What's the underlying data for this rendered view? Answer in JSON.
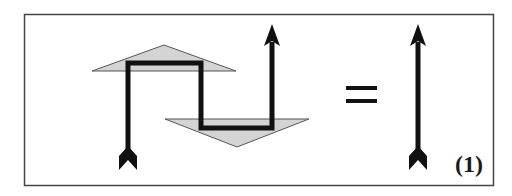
{
  "figure": {
    "equation_label": "(1)",
    "equals_sign": "=",
    "colors": {
      "stroke": "#111111",
      "triangle_fill": "#d4d4d4",
      "triangle_stroke": "#555555",
      "frame": "#444444",
      "background": "#ffffff"
    }
  }
}
